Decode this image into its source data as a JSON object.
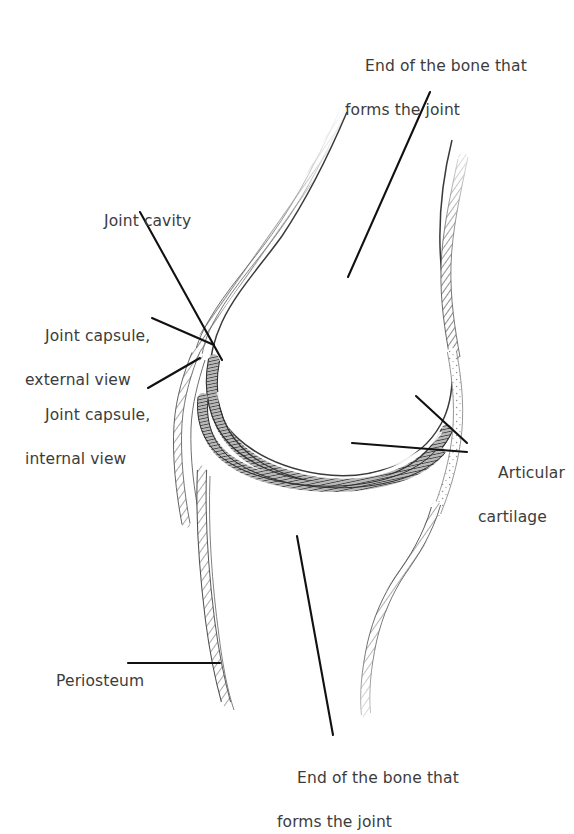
{
  "figure": {
    "type": "anatomical-line-diagram",
    "background_color": "#ffffff",
    "text_color": "#3c3c3c",
    "leader_line_color": "#111111"
  },
  "labels": {
    "top_bone": {
      "line1": "End of the bone that",
      "line2": "forms the joint"
    },
    "joint_cavity": {
      "line1": "Joint cavity",
      "line2": ""
    },
    "joint_capsule_external": {
      "line1": "Joint capsule,",
      "line2": "external view"
    },
    "joint_capsule_internal": {
      "line1": "Joint capsule,",
      "line2": "internal view"
    },
    "articular_cartilage": {
      "line1": "Articular",
      "line2": "cartilage"
    },
    "periosteum": {
      "line1": "Periosteum",
      "line2": ""
    },
    "bottom_bone": {
      "line1": "End of the bone that",
      "line2": "forms the joint"
    }
  },
  "structures": [
    {
      "name": "upper-bone-epiphysis",
      "description": "rounded end of upper bone"
    },
    {
      "name": "articular-cartilage-upper",
      "description": "dark hatched band on upper bone end"
    },
    {
      "name": "articular-cartilage-lower",
      "description": "dark hatched band on lower bone end"
    },
    {
      "name": "joint-cavity",
      "description": "space between the two cartilage layers"
    },
    {
      "name": "joint-capsule",
      "description": "fibrous sleeve enclosing the joint"
    },
    {
      "name": "periosteum",
      "description": "hatched membrane along bone shaft"
    },
    {
      "name": "lower-bone-shaft",
      "description": "shaft of lower bone"
    }
  ]
}
